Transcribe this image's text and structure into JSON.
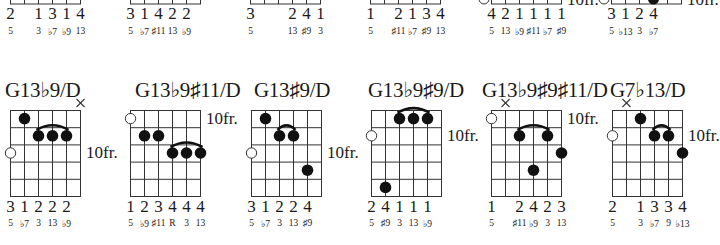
{
  "top_row": [
    {
      "fingers": [
        "2",
        "",
        "1",
        "3",
        "1",
        "4"
      ],
      "intervals": [
        "5",
        "",
        "3",
        "♭7",
        "♭9",
        "13"
      ],
      "x": 10
    },
    {
      "fingers": [
        "3",
        "1",
        "4",
        "2",
        "2",
        ""
      ],
      "intervals": [
        "5",
        "♭7",
        "♯11",
        "13",
        "♭9",
        ""
      ],
      "x": 130
    },
    {
      "fingers": [
        "3",
        "",
        "",
        "2",
        "4",
        "1"
      ],
      "intervals": [
        "5",
        "",
        "",
        "13",
        "♯9",
        "3"
      ],
      "x": 250
    },
    {
      "fingers": [
        "1",
        "",
        "2",
        "1",
        "3",
        "4"
      ],
      "intervals": [
        "5",
        "",
        "♯11",
        "♭7",
        "♯9",
        "13"
      ],
      "x": 370
    },
    {
      "fingers": [
        "4",
        "2",
        "1",
        "1",
        "1",
        "1"
      ],
      "intervals": [
        "5",
        "13",
        "♭9",
        "♯11",
        "♭7",
        "♯9"
      ],
      "x": 491,
      "fret_label": "10fr."
    },
    {
      "fingers": [
        "3",
        "1",
        "2",
        "4",
        "",
        ""
      ],
      "intervals": [
        "5",
        "♭13",
        "3",
        "♭7",
        "",
        ""
      ],
      "x": 611,
      "fret_label": "10fr."
    }
  ],
  "bottom_row": [
    {
      "name": "G13♭9/D",
      "fret_label": "10fr.",
      "fret_label_row": 2,
      "muted": [
        5
      ],
      "open_marker_row": 2,
      "dots": [
        [
          1,
          0
        ],
        [
          2,
          1
        ],
        [
          3,
          1
        ],
        [
          4,
          1
        ]
      ],
      "barre": {
        "from": 2,
        "to": 4,
        "row": 1
      },
      "fingers": [
        "3",
        "1",
        "2",
        "2",
        "2",
        ""
      ],
      "intervals": [
        "5",
        "♭7",
        "3",
        "13",
        "♭9",
        ""
      ]
    },
    {
      "name": "G13♭9♯11/D",
      "fret_label": "10fr.",
      "fret_label_row": 0,
      "muted": [],
      "open_marker_row": 0,
      "dots": [
        [
          1,
          1
        ],
        [
          2,
          1
        ],
        [
          3,
          2
        ],
        [
          4,
          2
        ],
        [
          5,
          2
        ]
      ],
      "barre": {
        "from": 3,
        "to": 5,
        "row": 2
      },
      "fingers": [
        "1",
        "2",
        "3",
        "4",
        "4",
        "4"
      ],
      "intervals": [
        "5",
        "♭9",
        "♯11",
        "R",
        "3",
        "13"
      ]
    },
    {
      "name": "G13♯9/D",
      "fret_label": "10fr.",
      "fret_label_row": 2,
      "muted": [],
      "open_marker_row": 2,
      "dots": [
        [
          1,
          0
        ],
        [
          2,
          1
        ],
        [
          3,
          1
        ],
        [
          4,
          3
        ]
      ],
      "barre": {
        "from": 2,
        "to": 3,
        "row": 1
      },
      "fingers": [
        "3",
        "1",
        "2",
        "2",
        "4",
        ""
      ],
      "intervals": [
        "5",
        "♭7",
        "3",
        "13",
        "♯9",
        ""
      ]
    },
    {
      "name": "G13♭9♯9/D",
      "fret_label": "10fr.",
      "fret_label_row": 1,
      "muted": [],
      "open_marker_row": 1,
      "dots": [
        [
          1,
          4
        ],
        [
          2,
          0
        ],
        [
          3,
          0
        ],
        [
          4,
          0
        ]
      ],
      "barre": {
        "from": 2,
        "to": 4,
        "row": 0
      },
      "fingers": [
        "2",
        "4",
        "1",
        "1",
        "1",
        ""
      ],
      "intervals": [
        "5",
        "♯9",
        "3",
        "13",
        "♭9",
        ""
      ]
    },
    {
      "name": "G13♭9♯9♯11/D",
      "fret_label": "10fr.",
      "fret_label_row": 0,
      "muted": [
        1
      ],
      "open_marker_row": 0,
      "dots": [
        [
          2,
          1
        ],
        [
          3,
          3
        ],
        [
          4,
          1
        ],
        [
          5,
          2
        ]
      ],
      "barre": {
        "from": 2,
        "to": 4,
        "row": 1
      },
      "fingers": [
        "1",
        "",
        "2",
        "4",
        "2",
        "3"
      ],
      "intervals": [
        "5",
        "",
        "♯11",
        "♭9",
        "3",
        "13"
      ]
    },
    {
      "name": "G7♭13/D",
      "fret_label": "10fr.",
      "fret_label_row": 1,
      "muted": [
        1
      ],
      "open_marker_row": 1,
      "dots": [
        [
          2,
          0
        ],
        [
          3,
          1
        ],
        [
          4,
          1
        ],
        [
          5,
          2
        ]
      ],
      "barre": {
        "from": 3,
        "to": 4,
        "row": 1
      },
      "fingers": [
        "2",
        "",
        "1",
        "3",
        "3",
        "4"
      ],
      "intervals": [
        "5",
        "",
        "3",
        "♭7",
        "9",
        "♭13"
      ]
    }
  ]
}
